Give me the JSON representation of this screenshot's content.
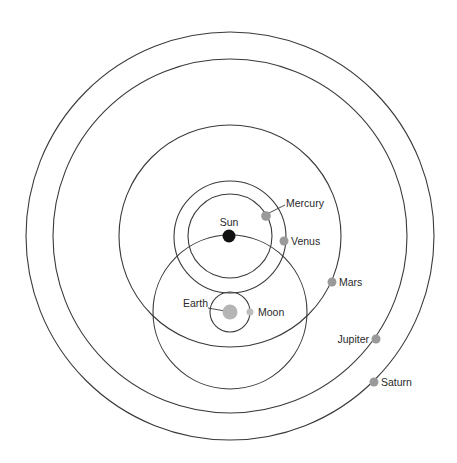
{
  "diagram": {
    "type": "tychonic-geo-heliocentric-model",
    "colors": {
      "background": "#ffffff",
      "orbit_stroke": "#3a3a3a",
      "sun": "#111111",
      "planet": "#9a9a9a",
      "earth": "#b5b5b5",
      "moon": "#bdbdbd",
      "label": "#2a2a2a"
    },
    "bodies": {
      "sun": {
        "label": "Sun"
      },
      "mercury": {
        "label": "Mercury"
      },
      "venus": {
        "label": "Venus"
      },
      "earth": {
        "label": "Earth"
      },
      "moon": {
        "label": "Moon"
      },
      "mars": {
        "label": "Mars"
      },
      "jupiter": {
        "label": "Jupiter"
      },
      "saturn": {
        "label": "Saturn"
      }
    },
    "orbits": [
      {
        "name": "saturn-orbit",
        "center": "sun",
        "cx": 230,
        "cy": 236,
        "r": 204
      },
      {
        "name": "jupiter-orbit",
        "center": "sun",
        "cx": 230,
        "cy": 236,
        "r": 177
      },
      {
        "name": "mars-orbit",
        "center": "sun",
        "cx": 230,
        "cy": 236,
        "r": 111
      },
      {
        "name": "venus-orbit",
        "center": "sun",
        "cx": 230,
        "cy": 237,
        "r": 56
      },
      {
        "name": "mercury-orbit",
        "center": "sun",
        "cx": 230,
        "cy": 236,
        "r": 42
      },
      {
        "name": "sun-orbit",
        "center": "earth",
        "cx": 230,
        "cy": 312,
        "r": 77
      },
      {
        "name": "moon-orbit",
        "center": "earth",
        "cx": 230,
        "cy": 312,
        "r": 20
      }
    ]
  }
}
